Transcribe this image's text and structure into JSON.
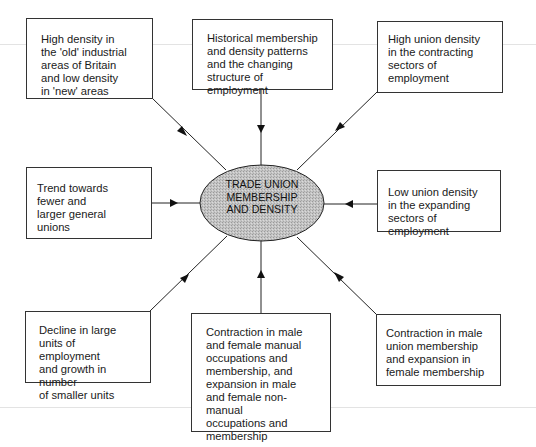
{
  "diagram": {
    "center": {
      "label": "TRADE UNION\nMEMBERSHIP\nAND DENSITY",
      "fill_color": "#bdbdbd",
      "shape": "ellipse"
    },
    "nodes": [
      {
        "id": "top-left",
        "text": "High density in\nthe 'old' industrial\nareas of Britain\nand low density\nin 'new' areas"
      },
      {
        "id": "top-center",
        "text": "Historical membership\nand density patterns\nand the changing\nstructure of employment"
      },
      {
        "id": "top-right",
        "text": "High union density\nin the contracting\nsectors of\nemployment"
      },
      {
        "id": "middle-left",
        "text": "Trend towards\nfewer and\nlarger general\nunions"
      },
      {
        "id": "middle-right",
        "text": "Low union density\nin the expanding\nsectors of employment"
      },
      {
        "id": "bottom-left",
        "text": "Decline in large\nunits of employment\nand growth in number\nof smaller units"
      },
      {
        "id": "bottom-center",
        "text": "Contraction in male\nand female manual\noccupations and\nmembership, and\nexpansion in male\nand female non-manual\noccupations and\nmembership"
      },
      {
        "id": "bottom-right",
        "text": "Contraction in male\nunion membership\nand expansion in\nfemale membership"
      }
    ],
    "edges": [
      {
        "from": "top-left",
        "to": "center",
        "arrow": "toward-center"
      },
      {
        "from": "top-center",
        "to": "center",
        "arrow": "toward-center"
      },
      {
        "from": "top-right",
        "to": "center",
        "arrow": "toward-center"
      },
      {
        "from": "middle-left",
        "to": "center",
        "arrow": "toward-center"
      },
      {
        "from": "middle-right",
        "to": "center",
        "arrow": "toward-center"
      },
      {
        "from": "bottom-left",
        "to": "center",
        "arrow": "toward-center"
      },
      {
        "from": "bottom-center",
        "to": "center",
        "arrow": "toward-center"
      },
      {
        "from": "bottom-right",
        "to": "center",
        "arrow": "toward-center"
      }
    ]
  }
}
